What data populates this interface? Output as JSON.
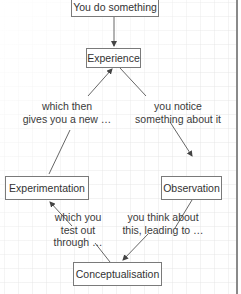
{
  "diagram": {
    "nodes": {
      "start": "You do something",
      "experience": "Experience",
      "observation": "Observation",
      "conceptualisation": "Conceptualisation",
      "experimentation": "Experimentation"
    },
    "edge_labels": {
      "experience_to_observation_1": "you notice",
      "experience_to_observation_2": "something about it",
      "observation_to_conceptualisation_1": "you think about",
      "observation_to_conceptualisation_2": "this, leading to …",
      "conceptualisation_to_experimentation_1": "which you",
      "conceptualisation_to_experimentation_2": "test out",
      "conceptualisation_to_experimentation_3": "through …",
      "experimentation_to_experience_1": "which then",
      "experimentation_to_experience_2": "gives you a new …"
    },
    "colors": {
      "line": "#555555",
      "box_border": "#7a7a7a",
      "grid": "#e4e4e4"
    }
  }
}
